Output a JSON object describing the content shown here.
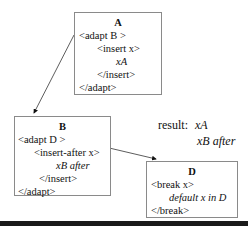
{
  "boxes": {
    "A": {
      "title": "A",
      "lines": [
        "<adapt B >",
        "<insert x>",
        "xA",
        "</insert>",
        "</adapt>"
      ]
    },
    "B": {
      "title": "B",
      "lines": [
        "<adapt D >",
        "<insert-after x>",
        "xB after",
        "</insert>",
        "</adapt>"
      ]
    },
    "D": {
      "title": "D",
      "lines": [
        "<break x>",
        "default x in D",
        "</break>"
      ]
    }
  },
  "result": {
    "label": "result:",
    "line1": "xA",
    "line2": "xB after"
  },
  "arrows": [
    {
      "from": "A.adapt",
      "to": "B"
    },
    {
      "from": "B.adapt",
      "to": "D"
    }
  ]
}
